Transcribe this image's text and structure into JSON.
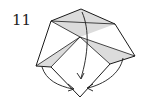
{
  "step": {
    "number": "11"
  },
  "diagram": {
    "colors": {
      "line": "#1a1a1a",
      "shade": "#d9d9d9",
      "background": "#ffffff"
    },
    "arrows": [
      {
        "name": "center-fold-arrow",
        "direction": "down"
      },
      {
        "name": "left-fold-arrow",
        "direction": "down-right"
      },
      {
        "name": "right-fold-arrow",
        "direction": "down-left"
      }
    ]
  }
}
